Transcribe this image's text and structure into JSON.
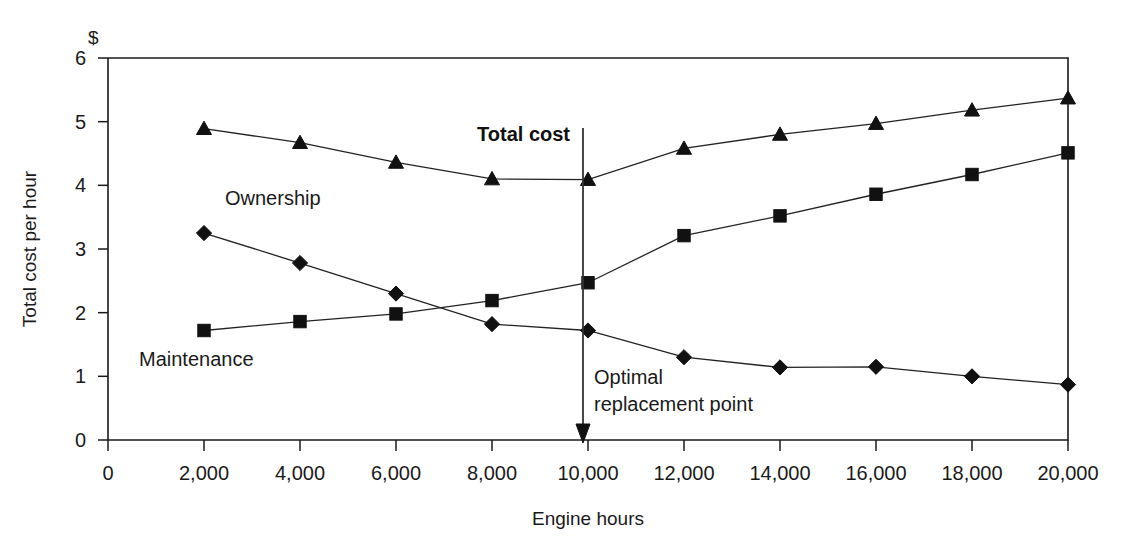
{
  "chart_data": {
    "type": "line",
    "title": "",
    "xlabel": "Engine hours",
    "ylabel": "Total cost per hour",
    "unit_label": "$",
    "x": [
      2000,
      4000,
      6000,
      8000,
      10000,
      12000,
      14000,
      16000,
      18000,
      20000
    ],
    "xlim": [
      0,
      20000
    ],
    "ylim": [
      0,
      6
    ],
    "x_ticks": [
      0,
      2000,
      4000,
      6000,
      8000,
      10000,
      12000,
      14000,
      16000,
      18000,
      20000
    ],
    "x_tick_labels": [
      "0",
      "2,000",
      "4,000",
      "6,000",
      "8,000",
      "10,000",
      "12,000",
      "14,000",
      "16,000",
      "18,000",
      "20,000"
    ],
    "y_ticks": [
      0,
      1,
      2,
      3,
      4,
      5,
      6
    ],
    "y_tick_labels": [
      "0",
      "1",
      "2",
      "3",
      "4",
      "5",
      "6"
    ],
    "grid": false,
    "legend_position": "inline-annotations",
    "series": [
      {
        "name": "Total cost",
        "marker": "triangle",
        "label_text": "Total cost",
        "values": [
          4.89,
          4.67,
          4.36,
          4.1,
          4.09,
          4.58,
          4.8,
          4.97,
          5.18,
          5.37
        ]
      },
      {
        "name": "Maintenance",
        "marker": "square",
        "label_text": "Maintenance",
        "values": [
          1.72,
          1.86,
          1.98,
          2.19,
          2.47,
          3.21,
          3.52,
          3.86,
          4.17,
          4.51
        ]
      },
      {
        "name": "Ownership",
        "marker": "diamond",
        "label_text": "Ownership",
        "values": [
          3.25,
          2.78,
          2.3,
          1.82,
          1.72,
          1.3,
          1.14,
          1.15,
          1.0,
          0.87
        ]
      }
    ],
    "annotations": [
      {
        "id": "total-cost",
        "text": "Total cost",
        "x": 10000,
        "style": "bold"
      },
      {
        "id": "optimal-replacement-point",
        "text_line_1": "Optimal",
        "text_line_2": "replacement point",
        "x": 10000,
        "style": "normal"
      },
      {
        "id": "ownership-label",
        "text": "Ownership"
      },
      {
        "id": "maintenance-label",
        "text": "Maintenance"
      }
    ],
    "marker_arrow": {
      "at_x": 10000,
      "description": "vertical arrow marking optimal replacement point"
    },
    "colors": {
      "line": "#222222",
      "marker": "#111111",
      "axis": "#1a1a1a",
      "background": "#ffffff"
    }
  }
}
